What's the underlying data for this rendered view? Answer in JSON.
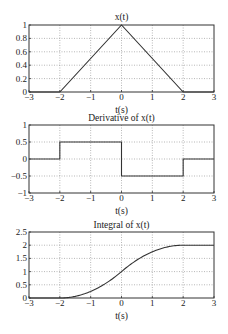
{
  "chart_data": [
    {
      "type": "line",
      "title": "x(t)",
      "xlabel": "t(s)",
      "ylabel": "",
      "xlim": [
        -3,
        3
      ],
      "ylim": [
        0,
        1
      ],
      "xticks": [
        -3,
        -2,
        -1,
        0,
        1,
        2,
        3
      ],
      "xtick_labels": [
        "-3",
        "-2",
        "-1",
        "0",
        "1",
        "2",
        "3"
      ],
      "yticks": [
        0,
        0.2,
        0.4,
        0.6,
        0.8,
        1
      ],
      "ytick_labels": [
        "0",
        "0.2",
        "0.4",
        "0.6",
        "0.8",
        "1"
      ],
      "grid": true,
      "series": [
        {
          "name": "x(t)",
          "x": [
            -3,
            -2,
            0,
            2,
            3
          ],
          "y": [
            0,
            0,
            1,
            0,
            0
          ]
        }
      ]
    },
    {
      "type": "line",
      "title": "Derivative of x(t)",
      "xlabel": "t(s)",
      "ylabel": "",
      "xlim": [
        -3,
        3
      ],
      "ylim": [
        -1,
        1
      ],
      "xticks": [
        -3,
        -2,
        -1,
        0,
        1,
        2,
        3
      ],
      "xtick_labels": [
        "-3",
        "-2",
        "-1",
        "0",
        "1",
        "2",
        "3"
      ],
      "yticks": [
        -1,
        -0.5,
        0,
        0.5,
        1
      ],
      "ytick_labels": [
        "-1",
        "-0.5",
        "0",
        "0.5",
        "1"
      ],
      "grid": true,
      "series": [
        {
          "name": "dx/dt",
          "x": [
            -3,
            -2,
            -2,
            0,
            0,
            2,
            2,
            3
          ],
          "y": [
            0,
            0,
            0.5,
            0.5,
            -0.5,
            -0.5,
            0,
            0
          ]
        }
      ]
    },
    {
      "type": "line",
      "title": "Integral of x(t)",
      "xlabel": "t(s)",
      "ylabel": "",
      "xlim": [
        -3,
        3
      ],
      "ylim": [
        0,
        2.5
      ],
      "xticks": [
        -3,
        -2,
        -1,
        0,
        1,
        2,
        3
      ],
      "xtick_labels": [
        "-3",
        "-2",
        "-1",
        "0",
        "1",
        "2",
        "3"
      ],
      "yticks": [
        0,
        0.5,
        1,
        1.5,
        2,
        2.5
      ],
      "ytick_labels": [
        "0",
        "0.5",
        "1",
        "1.5",
        "2",
        "2.5"
      ],
      "grid": true,
      "series": [
        {
          "name": "integral",
          "x": [
            -3,
            -2,
            -1.5,
            -1,
            -0.5,
            0,
            0.5,
            1,
            1.5,
            2,
            3
          ],
          "y": [
            0,
            0,
            0.0625,
            0.25,
            0.5625,
            1,
            1.4375,
            1.75,
            1.9375,
            2,
            2
          ]
        }
      ]
    }
  ],
  "layout": {
    "axes_px": [
      {
        "left": 29,
        "right": 214,
        "top": 25,
        "bottom": 92,
        "title_y": 20,
        "xlabel_y": 113
      },
      {
        "left": 29,
        "right": 214,
        "top": 125,
        "bottom": 193,
        "title_y": 121,
        "xlabel_y": 214
      },
      {
        "left": 29,
        "right": 214,
        "top": 232,
        "bottom": 298,
        "title_y": 228,
        "xlabel_y": 319
      }
    ],
    "colors": {
      "line": "#333333",
      "axis": "#333333",
      "grid": "#9a9a9a"
    }
  }
}
